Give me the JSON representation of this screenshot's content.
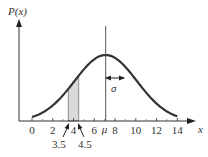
{
  "chart_data": {
    "type": "line",
    "title": "",
    "ylabel": "P(x)",
    "xlabel": "x",
    "xlim": [
      -1.2,
      15.5
    ],
    "x_ticks": [
      0,
      2,
      4,
      6,
      8,
      10,
      12,
      14
    ],
    "x_tick_labels": [
      "0",
      "2",
      "4",
      "6",
      "8",
      "10",
      "12",
      "14"
    ],
    "grid": false,
    "distribution": "normal",
    "mean": 7.1,
    "sigma": 3.0,
    "curve_range": [
      0,
      14
    ],
    "shaded_region": {
      "from": 3.5,
      "to": 4.5,
      "color": "#d9d9d9"
    },
    "annotations": [
      {
        "text": "μ",
        "x": 7.1,
        "position": "x-axis",
        "note": "mean marked with vertical line"
      },
      {
        "text": "σ",
        "note": "double-headed arrow from mean line to curve, one standard deviation"
      },
      {
        "text": "3.5",
        "x": 3.5,
        "note": "arrow pointing to left edge of shaded strip"
      },
      {
        "text": "4.5",
        "x": 4.5,
        "note": "arrow pointing to right edge of shaded strip"
      }
    ],
    "colors": {
      "curve": "#333333",
      "axes": "#333333",
      "mean_line": "#555555",
      "shade": "#d9d9d9"
    }
  },
  "labels": {
    "y_axis": "P(x)",
    "x_axis": "x",
    "mu": "μ",
    "sigma": "σ",
    "left_edge": "3.5",
    "right_edge": "4.5"
  }
}
